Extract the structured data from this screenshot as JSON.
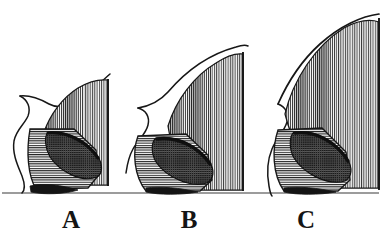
{
  "figure": {
    "kind": "engraved-line-art-scientific-figure",
    "caption_letters": [
      "A",
      "B",
      "C"
    ],
    "background_color": "#ffffff",
    "ink_color": "#171717",
    "baseline": {
      "label": "ground-line",
      "y": 193,
      "x_start": 2,
      "x_end": 379,
      "color": "#3a3a3a"
    },
    "specimens": [
      {
        "id": "A",
        "label": "A",
        "label_x": 56,
        "label_y": 207,
        "size_rank": 1,
        "description": "smallest specimen",
        "outline_color": "#171717",
        "fan": {
          "name": "upper-fan",
          "hatching": "vertical",
          "apex_x": 108,
          "top_y": 76,
          "base_y": 185,
          "left_x": 44
        },
        "lobe": {
          "name": "lower-lobe",
          "hatching": "horizontal",
          "top_y": 128,
          "base_y": 192,
          "left_x": 20,
          "right_x": 98
        },
        "overlap": {
          "name": "overlap-lens",
          "hatching": "cross",
          "shading": "dark"
        },
        "profile": {
          "name": "left-sigmoid-profile",
          "top_y": 96,
          "bottom_y": 192
        }
      },
      {
        "id": "B",
        "label": "B",
        "label_x": 174,
        "label_y": 207,
        "size_rank": 2,
        "description": "medium specimen",
        "outline_color": "#171717",
        "fan": {
          "name": "upper-fan",
          "hatching": "vertical",
          "apex_x": 243,
          "top_y": 48,
          "base_y": 190,
          "left_x": 168
        },
        "lobe": {
          "name": "lower-lobe",
          "hatching": "horizontal",
          "top_y": 134,
          "base_y": 192,
          "left_x": 128,
          "right_x": 212
        },
        "overlap": {
          "name": "overlap-lens",
          "hatching": "cross",
          "shading": "dark"
        },
        "profile": {
          "name": "left-sigmoid-profile",
          "top_y": 108,
          "bottom_y": 173
        }
      },
      {
        "id": "C",
        "label": "C",
        "label_x": 291,
        "label_y": 207,
        "size_rank": 3,
        "description": "largest specimen",
        "outline_color": "#171717",
        "fan": {
          "name": "upper-fan",
          "hatching": "vertical",
          "apex_x": 378,
          "top_y": 18,
          "base_y": 188,
          "left_x": 284
        },
        "lobe": {
          "name": "lower-lobe",
          "hatching": "horizontal",
          "top_y": 128,
          "base_y": 192,
          "left_x": 268,
          "right_x": 348
        },
        "overlap": {
          "name": "overlap-lens",
          "hatching": "cross",
          "shading": "dark"
        },
        "profile": {
          "name": "left-sigmoid-profile",
          "top_y": 104,
          "bottom_y": 196
        }
      }
    ]
  }
}
